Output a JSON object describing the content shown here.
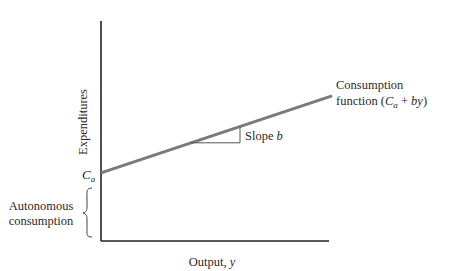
{
  "chart_data": {
    "type": "line",
    "title": "",
    "xlabel": "Output, y",
    "ylabel": "Expenditures",
    "xlabel_parts": {
      "text": "Output, ",
      "var": "y"
    },
    "series": [
      {
        "name": "Consumption function (Ca + by)",
        "label_line1": "Consumption",
        "label_line2_prefix": "function (",
        "label_var_C": "C",
        "label_var_sub": "a",
        "label_plus": " + ",
        "label_var_by": "by",
        "label_close": ")",
        "x": [
          0,
          1
        ],
        "y": [
          0.31,
          0.66
        ]
      }
    ],
    "intercept_label": {
      "main": "C",
      "sub": "a"
    },
    "slope_label": {
      "text": "Slope ",
      "var": "b"
    },
    "brace_label": [
      "Autonomous",
      "consumption"
    ],
    "xlim": [
      0,
      1
    ],
    "ylim": [
      0,
      1
    ],
    "grid": false,
    "legend": "none"
  },
  "colors": {
    "axis": "#222222",
    "line": "#7a7a7a",
    "text": "#2a2a2a"
  }
}
